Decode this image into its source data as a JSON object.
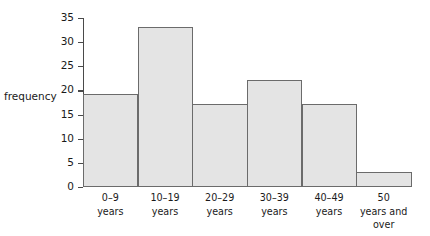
{
  "chart_data": {
    "type": "bar",
    "title": "",
    "xlabel": "",
    "ylabel": "frequency",
    "categories": [
      "0–9 years",
      "10–19 years",
      "20–29 years",
      "30–39 years",
      "40–49 years",
      "50 years and over"
    ],
    "category_lines": [
      [
        "0–9",
        "years"
      ],
      [
        "10–19",
        "years"
      ],
      [
        "20–29",
        "years"
      ],
      [
        "30–39",
        "years"
      ],
      [
        "40–49",
        "years"
      ],
      [
        "50",
        "years and",
        "over"
      ]
    ],
    "values": [
      19,
      33,
      17,
      22,
      17,
      3
    ],
    "ylim": [
      0,
      35
    ],
    "ytick_labels": [
      "35",
      "30",
      "25",
      "20",
      "15",
      "10",
      "5",
      "0"
    ],
    "ytick_values": [
      35,
      30,
      25,
      20,
      15,
      10,
      5,
      0
    ],
    "grid": false,
    "legend": false,
    "bar_fill_color": "#e4e4e4",
    "bar_edge_color": "#6b6b6b",
    "axis_color": "#4a4a4a",
    "background_color": "#ffffff"
  }
}
